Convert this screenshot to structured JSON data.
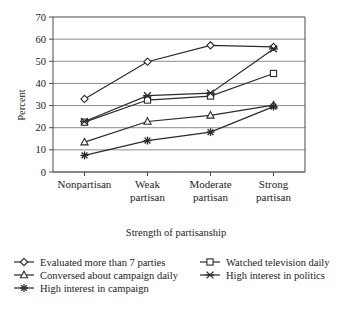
{
  "chart_data": {
    "type": "line",
    "title": "",
    "xlabel": "Strength of partisanship",
    "ylabel": "Percent",
    "categories": [
      "Nonpartisan",
      "Weak partisan",
      "Moderate partisan",
      "Strong partisan"
    ],
    "category_lines": [
      [
        "Nonpartisan",
        ""
      ],
      [
        "Weak",
        "partisan"
      ],
      [
        "Moderate",
        "partisan"
      ],
      [
        "Strong",
        "partisan"
      ]
    ],
    "ylim": [
      0,
      70
    ],
    "yticks": [
      0,
      10,
      20,
      30,
      40,
      50,
      60,
      70
    ],
    "ytick_labels": [
      "0",
      "10",
      "20",
      "30",
      "40",
      "50",
      "60",
      "70"
    ],
    "grid": true,
    "legend_position": "bottom",
    "series": [
      {
        "name": "Evaluated more than 7 parties",
        "marker": "diamond",
        "values": [
          33.0,
          49.8,
          57.2,
          56.5
        ]
      },
      {
        "name": "Watched television daily",
        "marker": "square",
        "values": [
          22.5,
          32.5,
          34.3,
          44.5
        ]
      },
      {
        "name": "Conversed about campaign daily",
        "marker": "triangle",
        "values": [
          13.5,
          22.8,
          25.6,
          30.2
        ]
      },
      {
        "name": "High interest in politics",
        "marker": "x-dash",
        "values": [
          22.8,
          34.5,
          35.6,
          55.6
        ]
      },
      {
        "name": "High interest in campaign",
        "marker": "asterisk",
        "values": [
          7.5,
          14.2,
          18.0,
          29.5
        ]
      }
    ]
  },
  "legend": {
    "entries": [
      {
        "label": "Evaluated more than 7 parties",
        "marker": "diamond"
      },
      {
        "label": "Watched television daily",
        "marker": "square"
      },
      {
        "label": "Conversed about campaign daily",
        "marker": "triangle"
      },
      {
        "label": "High interest in politics",
        "marker": "x-dash"
      },
      {
        "label": "High interest in campaign",
        "marker": "asterisk"
      }
    ]
  }
}
